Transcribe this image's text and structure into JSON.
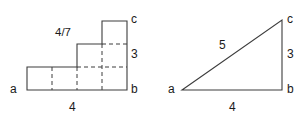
{
  "figure_left": {
    "name": "staircase-polygon",
    "vertices_labels": [
      {
        "id": "a",
        "text": "a",
        "x": 10,
        "y": 83
      },
      {
        "id": "b",
        "text": "b",
        "x": 131,
        "y": 83
      },
      {
        "id": "c",
        "text": "c",
        "x": 131,
        "y": 13
      }
    ],
    "measure_labels": [
      {
        "id": "base",
        "text": "4",
        "x": 69,
        "y": 101
      },
      {
        "id": "height",
        "text": "3",
        "x": 131,
        "y": 48
      },
      {
        "id": "fraction",
        "text": "4/7",
        "x": 55,
        "y": 27
      }
    ],
    "outline_points": "27,90 27,67 77,67 77,44 102,44 102,21 127,21 127,90",
    "grid_lines": [
      {
        "id": "v1",
        "x1": 52,
        "y1": 67,
        "x2": 52,
        "y2": 90
      },
      {
        "id": "v2",
        "x1": 77,
        "y1": 67,
        "x2": 77,
        "y2": 90
      },
      {
        "id": "v3",
        "x1": 102,
        "y1": 44,
        "x2": 102,
        "y2": 90
      },
      {
        "id": "h1",
        "x1": 77,
        "y1": 67,
        "x2": 127,
        "y2": 67
      },
      {
        "id": "h2",
        "x1": 102,
        "y1": 44,
        "x2": 127,
        "y2": 44
      }
    ]
  },
  "figure_right": {
    "name": "right-triangle",
    "vertices_labels": [
      {
        "id": "a",
        "text": "a",
        "x": 168,
        "y": 83
      },
      {
        "id": "b",
        "text": "b",
        "x": 287,
        "y": 83
      },
      {
        "id": "c",
        "text": "c",
        "x": 287,
        "y": 13
      }
    ],
    "measure_labels": [
      {
        "id": "hypotenuse",
        "text": "5",
        "x": 219,
        "y": 39
      },
      {
        "id": "vertical",
        "text": "3",
        "x": 287,
        "y": 48
      },
      {
        "id": "base",
        "text": "4",
        "x": 229,
        "y": 101
      }
    ],
    "outline_points": "182,90 282,90 282,20"
  },
  "style": {
    "stroke_color": "#3c3c3c",
    "text_color": "#1a1a1a",
    "background": "#ffffff"
  }
}
